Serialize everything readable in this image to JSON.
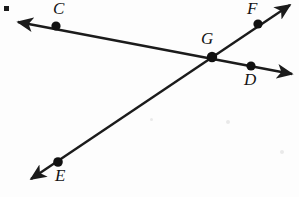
{
  "figure": {
    "width": 299,
    "height": 197,
    "background_color": "#fdfdfd",
    "ink_color": "#1b1b1b"
  },
  "labels": {
    "c": "C",
    "d": "D",
    "e": "E",
    "f": "F",
    "g": "G"
  },
  "points": [
    {
      "name": "C",
      "label": "C",
      "x": 56,
      "y": 26,
      "label_x": 53,
      "label_y": 0
    },
    {
      "name": "G",
      "label": "G",
      "x": 212,
      "y": 57,
      "label_x": 201,
      "label_y": 30
    },
    {
      "name": "D",
      "label": "D",
      "x": 251,
      "y": 66,
      "label_x": 244,
      "label_y": 71
    },
    {
      "name": "F",
      "label": "F",
      "x": 258,
      "y": 24,
      "label_x": 247,
      "label_y": 0
    },
    {
      "name": "E",
      "label": "E",
      "x": 58,
      "y": 162,
      "label_x": 55,
      "label_y": 167
    }
  ],
  "lines": [
    {
      "name": "line-cd",
      "through": [
        "C",
        "G",
        "D"
      ],
      "arrow_start": {
        "x": 18,
        "y": 22
      },
      "arrow_end": {
        "x": 292,
        "y": 74
      },
      "double_arrow": true
    },
    {
      "name": "line-ef",
      "through": [
        "E",
        "G",
        "F"
      ],
      "arrow_start": {
        "x": 31,
        "y": 179
      },
      "arrow_end": {
        "x": 290,
        "y": 5
      },
      "double_arrow": true
    }
  ],
  "marks": {
    "corner_square": {
      "x": 4,
      "y": 6,
      "size": 5
    }
  }
}
